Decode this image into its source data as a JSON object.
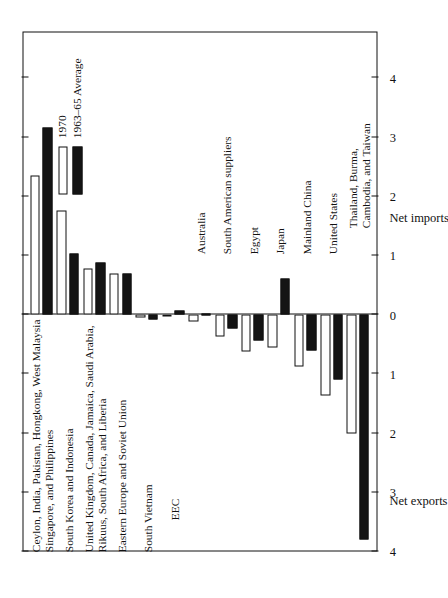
{
  "figure": {
    "axis_titles": {
      "positive": "Net exports",
      "negative": "Net imports"
    },
    "tick_labels": [
      "4",
      "3",
      "2",
      "1",
      "0",
      "1",
      "2",
      "3",
      "4"
    ],
    "legend": [
      {
        "key": "1970",
        "label": "1970",
        "fill": "#ffffff"
      },
      {
        "key": "1963_65",
        "label": "1963–65 Average",
        "fill": "#141414"
      }
    ],
    "colors": {
      "white_bar": "#ffffff",
      "black_bar": "#141414",
      "axis": "#111111"
    }
  },
  "chart_data": {
    "type": "bar",
    "title": "",
    "xlabel": "",
    "ylabel": "Net exports / Net imports",
    "ylim": [
      -4,
      4
    ],
    "grid": false,
    "legend_position": "inside-lower-left",
    "orientation": "vertical-rotated-90",
    "note": "Positive values = net exports; negative values = net imports",
    "categories": [
      "Ceylon, India, Pakistan, Hongkong, West Malaysia Singapore, and Philippines",
      "South Korea and Indonesia",
      "United Kingdom, Canada, Jamaica, Saudi Arabia, Rikuus, South Africa, and Liberia",
      "Eastern Europe and Soviet Union",
      "South Vietnam",
      "EEC",
      "Australia",
      "South American suppliers",
      "Egypt",
      "Japan",
      "Mainland China",
      "United States",
      "Thailand, Burma, Cambodia, and Taiwan"
    ],
    "series": [
      {
        "name": "1970",
        "values": [
          -2.35,
          -1.75,
          -0.78,
          -0.68,
          0.06,
          0.04,
          0.13,
          0.37,
          0.63,
          0.57,
          0.88,
          1.38,
          2.02
        ]
      },
      {
        "name": "1963–65 Average",
        "values": [
          -3.15,
          -1.02,
          -0.88,
          -0.68,
          0.09,
          -0.06,
          0.03,
          0.25,
          0.45,
          -0.6,
          0.62,
          1.1,
          3.8
        ]
      }
    ]
  },
  "category_labels": [
    {
      "lines": [
        "Ceylon, India, Pakistan, Hongkong, West Malaysia",
        "Singapore, and Philippines"
      ]
    },
    {
      "lines": [
        "South Korea and Indonesia"
      ]
    },
    {
      "lines": [
        "United Kingdom, Canada, Jamaica, Saudi Arabia,",
        "Rikuus, South Africa, and Liberia"
      ]
    },
    {
      "lines": [
        "Eastern Europe and Soviet Union"
      ]
    },
    {
      "lines": [
        "South Vietnam"
      ]
    },
    {
      "lines": [
        "EEC"
      ]
    },
    {
      "lines": [
        "Australia"
      ]
    },
    {
      "lines": [
        "South American suppliers"
      ]
    },
    {
      "lines": [
        "Egypt"
      ]
    },
    {
      "lines": [
        "Japan"
      ]
    },
    {
      "lines": [
        "Mainland China"
      ]
    },
    {
      "lines": [
        "United States"
      ]
    },
    {
      "lines": [
        "Thailand, Burma,",
        "Cambodia, and Taiwan"
      ]
    }
  ]
}
